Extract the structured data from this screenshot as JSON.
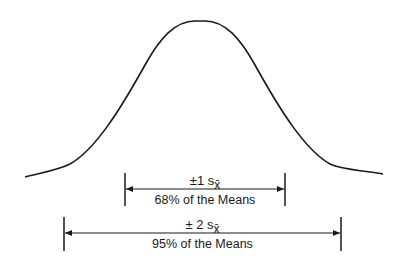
{
  "diagram": {
    "type": "normal-distribution-of-sample-means",
    "curve": {
      "name": "normal curve",
      "color": "#1a1a1a"
    },
    "brackets": [
      {
        "id": "one-sd",
        "top_label_prefix": "±1 s",
        "top_label_subscript": "x̄",
        "bottom_label": "68% of the Means"
      },
      {
        "id": "two-sd",
        "top_label_prefix": "± 2 s",
        "top_label_subscript": "x̄",
        "bottom_label": "95% of the Means"
      }
    ]
  }
}
